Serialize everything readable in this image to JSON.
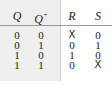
{
  "table": {
    "headers": [
      "Q",
      "Q",
      "R",
      "S"
    ],
    "header_superscript": "+",
    "rows": [
      [
        "0",
        "0",
        "X",
        "0"
      ],
      [
        "0",
        "1",
        "0",
        "1"
      ],
      [
        "1",
        "0",
        "1",
        "0"
      ],
      [
        "1",
        "1",
        "0",
        "X"
      ]
    ]
  }
}
